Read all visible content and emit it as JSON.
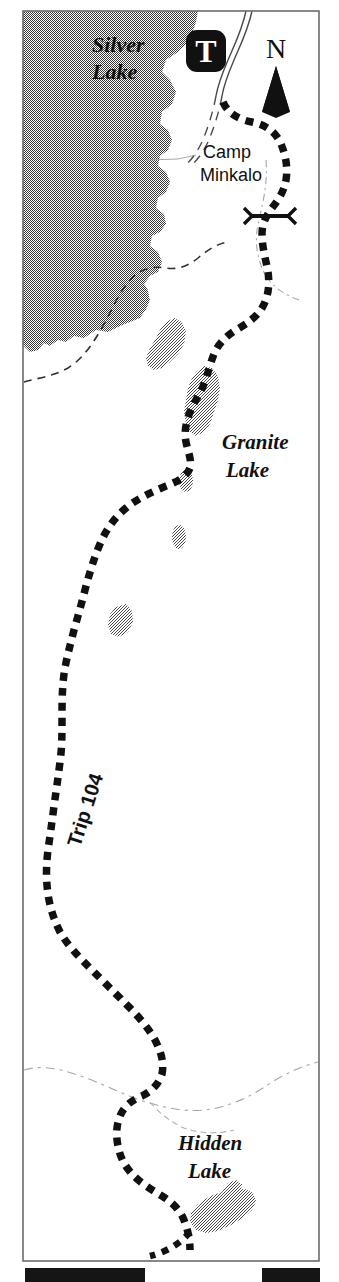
{
  "map": {
    "title": "Trip 104 Trail Map",
    "frame": {
      "x": 22,
      "y": 10,
      "width": 298,
      "height": 1252,
      "border_color": "#6b6b6b",
      "background": "#ffffff"
    },
    "labels": [
      {
        "id": "silver-lake",
        "text_line1": "Silver",
        "text_line2": "Lake",
        "x": 90,
        "y": 48,
        "style": "italic-serif",
        "size": 21
      },
      {
        "id": "camp-minkalo",
        "text_line1": "Camp",
        "text_line2": "Minkalo",
        "x": 203,
        "y": 152,
        "style": "sans",
        "size": 17
      },
      {
        "id": "granite-lake",
        "text_line1": "Granite",
        "text_line2": "Lake",
        "x": 222,
        "y": 444,
        "style": "italic-serif",
        "size": 20
      },
      {
        "id": "hidden-lake",
        "text_line1": "Hidden",
        "text_line2": "Lake",
        "x": 180,
        "y": 1145,
        "style": "italic-serif",
        "size": 20
      },
      {
        "id": "trip-104",
        "text_line1": "Trip 104",
        "text_line2": "",
        "x": 78,
        "y": 820,
        "style": "sans-bold",
        "size": 19,
        "rotation": -72
      }
    ],
    "north_arrow": {
      "letter": "N",
      "x": 276,
      "y": 52
    },
    "trailhead_marker": {
      "letter": "T",
      "x": 205,
      "y": 52,
      "fill": "#111111",
      "text_color": "#ffffff"
    },
    "features": {
      "main_trail": {
        "name": "Trip 104",
        "style": "heavy-dashed",
        "color": "#111111"
      },
      "secondary_trail": {
        "name": "side trail",
        "style": "thin-dashed",
        "color": "#333333"
      },
      "road": {
        "name": "access road",
        "style": "double-line",
        "color": "#444444"
      },
      "stream": {
        "name": "stream",
        "style": "thin-dotted",
        "color": "#9a9a9a"
      },
      "junction_marker": {
        "name": "trail junction",
        "style": "cross-tick",
        "color": "#111111"
      }
    },
    "water_bodies": [
      {
        "id": "silver-lake-body",
        "name": "Silver Lake",
        "fill": "#8f8f8f"
      },
      {
        "id": "granite-lake-body",
        "name": "Granite Lake",
        "fill": "#b5b5b5"
      },
      {
        "id": "hidden-lake-body",
        "name": "Hidden Lake",
        "fill": "#a8a8a8"
      },
      {
        "id": "pond-1",
        "name": "unnamed pond",
        "fill": "#b5b5b5"
      },
      {
        "id": "pond-2",
        "name": "unnamed pond",
        "fill": "#b5b5b5"
      },
      {
        "id": "pond-3",
        "name": "unnamed pond",
        "fill": "#b5b5b5"
      },
      {
        "id": "pond-4",
        "name": "unnamed pond",
        "fill": "#b5b5b5"
      },
      {
        "id": "pond-5",
        "name": "unnamed pond",
        "fill": "#b5b5b5"
      }
    ],
    "scale_bar": {
      "segments": [
        {
          "from": 25,
          "to": 145,
          "fill": "#151515"
        },
        {
          "from": 145,
          "to": 262,
          "fill": "#ffffff"
        },
        {
          "from": 262,
          "to": 320,
          "fill": "#151515"
        }
      ],
      "y": 1268,
      "height": 14
    }
  }
}
